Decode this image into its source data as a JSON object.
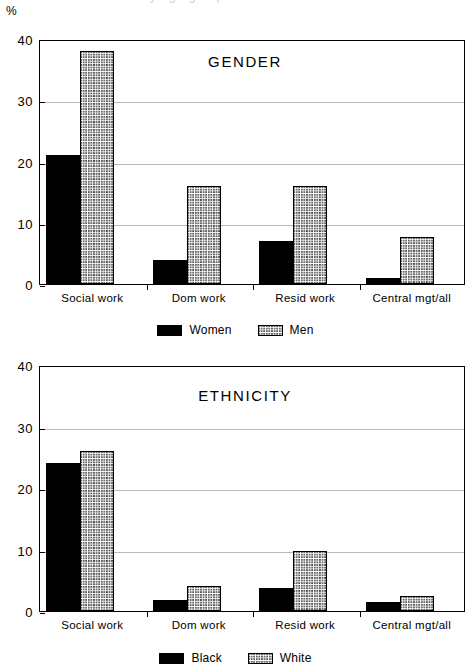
{
  "figure": {
    "axis_unit": "%",
    "cropped_caption_fragment": "y age group"
  },
  "charts": [
    {
      "title": "GENDER",
      "series_names": [
        "Women",
        "Men"
      ],
      "legend": [
        {
          "label": "Women",
          "pattern": "solid"
        },
        {
          "label": "Men",
          "pattern": "hatch"
        }
      ]
    },
    {
      "title": "ETHNICITY",
      "series_names": [
        "Black",
        "White"
      ],
      "legend": [
        {
          "label": "Black",
          "pattern": "solid"
        },
        {
          "label": "White",
          "pattern": "hatch"
        }
      ]
    }
  ],
  "chart_data": [
    {
      "type": "bar",
      "title": "GENDER",
      "xlabel": "",
      "ylabel": "%",
      "ylim": [
        0,
        40
      ],
      "yticks": [
        0,
        10,
        20,
        30,
        40
      ],
      "grid": true,
      "legend_position": "below",
      "categories": [
        "Social work",
        "Dom work",
        "Resid work",
        "Central mgt/all"
      ],
      "series": [
        {
          "name": "Women",
          "values": [
            21,
            4,
            7,
            1
          ]
        },
        {
          "name": "Men",
          "values": [
            38,
            16,
            16,
            7.7
          ]
        }
      ]
    },
    {
      "type": "bar",
      "title": "ETHNICITY",
      "xlabel": "",
      "ylabel": "%",
      "ylim": [
        0,
        40
      ],
      "yticks": [
        0,
        10,
        20,
        30,
        40
      ],
      "grid": true,
      "legend_position": "below",
      "categories": [
        "Social work",
        "Dom work",
        "Resid work",
        "Central mgt/all"
      ],
      "series": [
        {
          "name": "Black",
          "values": [
            24,
            1.8,
            3.8,
            1.5
          ]
        },
        {
          "name": "White",
          "values": [
            26,
            4,
            9.7,
            2.4
          ]
        }
      ]
    }
  ]
}
